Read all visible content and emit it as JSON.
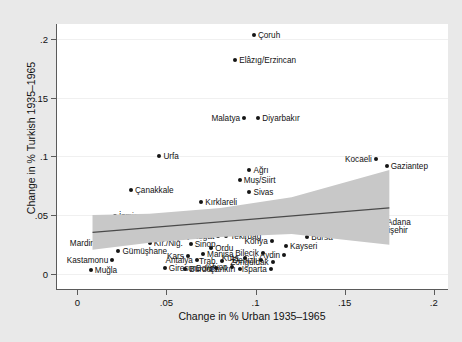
{
  "chart_data": {
    "type": "scatter",
    "title": "",
    "xlabel": "Change in % Urban 1935–1965",
    "ylabel": "Change in % Turkish 1935–1965",
    "xlim": [
      -0.012,
      0.208
    ],
    "ylim": [
      -0.014,
      0.213
    ],
    "xticks": [
      "0",
      ".05",
      ".1",
      ".15",
      ".2"
    ],
    "xtick_values": [
      0,
      0.05,
      0.1,
      0.15,
      0.2
    ],
    "yticks": [
      "0",
      ".05",
      ".1",
      ".15",
      ".2"
    ],
    "ytick_values": [
      0,
      0.05,
      0.1,
      0.15,
      0.2
    ],
    "grid": "horizontal-light",
    "legend": "none",
    "marker_color": "#151515",
    "fit_line_color": "#4a4a4a",
    "ci_band_color": "#c8c8c8",
    "fit_line": {
      "x": [
        0.008,
        0.175
      ],
      "y": [
        0.0345,
        0.0555
      ]
    },
    "ci_band": {
      "x": [
        0.008,
        0.04,
        0.08,
        0.12,
        0.175
      ],
      "upper": [
        0.0495,
        0.0505,
        0.0555,
        0.0645,
        0.088
      ],
      "lower": [
        0.0195,
        0.0255,
        0.0305,
        0.033,
        0.024
      ]
    },
    "points": [
      {
        "label": "Çoruh",
        "x": 0.0985,
        "y": 0.2035,
        "side": "right"
      },
      {
        "label": "Elâzıg/Erzincan",
        "x": 0.088,
        "y": 0.182,
        "side": "right"
      },
      {
        "label": "Malatya",
        "x": 0.093,
        "y": 0.133,
        "side": "left"
      },
      {
        "label": "Diyarbakır",
        "x": 0.101,
        "y": 0.1325,
        "side": "right"
      },
      {
        "label": "Urfa",
        "x": 0.0455,
        "y": 0.1,
        "side": "right"
      },
      {
        "label": "Kocaeli",
        "x": 0.167,
        "y": 0.098,
        "side": "left"
      },
      {
        "label": "Gaziantep",
        "x": 0.173,
        "y": 0.092,
        "side": "right"
      },
      {
        "label": "Ağrı",
        "x": 0.096,
        "y": 0.088,
        "side": "right"
      },
      {
        "label": "Muş/Siirt",
        "x": 0.0905,
        "y": 0.0795,
        "side": "right"
      },
      {
        "label": "Çanakkale",
        "x": 0.0295,
        "y": 0.0715,
        "side": "right"
      },
      {
        "label": "Sivas",
        "x": 0.096,
        "y": 0.07,
        "side": "right"
      },
      {
        "label": "Kırklareli",
        "x": 0.069,
        "y": 0.0615,
        "side": "right"
      },
      {
        "label": "Balıkesir",
        "x": 0.107,
        "y": 0.0545,
        "side": "right"
      },
      {
        "label": "Adana",
        "x": 0.171,
        "y": 0.044,
        "side": "right"
      },
      {
        "label": "İzmir",
        "x": 0.0205,
        "y": 0.049,
        "side": "right"
      },
      {
        "label": "Çorum",
        "x": 0.0465,
        "y": 0.045,
        "side": "right"
      },
      {
        "label": "Erzurum",
        "x": 0.111,
        "y": 0.042,
        "side": "right"
      },
      {
        "label": "Eskişehir",
        "x": 0.164,
        "y": 0.0375,
        "side": "right"
      },
      {
        "label": "Edirne",
        "x": 0.0345,
        "y": 0.041,
        "side": "left"
      },
      {
        "label": "Samsun",
        "x": 0.08,
        "y": 0.043,
        "side": "left"
      },
      {
        "label": "İçel",
        "x": 0.102,
        "y": 0.0395,
        "side": "left"
      },
      {
        "label": "Tokat",
        "x": 0.084,
        "y": 0.0375,
        "side": "left"
      },
      {
        "label": "Maraş",
        "x": 0.0255,
        "y": 0.034,
        "side": "left"
      },
      {
        "label": "Amasya",
        "x": 0.047,
        "y": 0.033,
        "side": "right"
      },
      {
        "label": "Yozgat",
        "x": 0.0785,
        "y": 0.0325,
        "side": "left"
      },
      {
        "label": "Tekirdağ",
        "x": 0.083,
        "y": 0.0325,
        "side": "right"
      },
      {
        "label": "Bursa",
        "x": 0.1285,
        "y": 0.031,
        "side": "right"
      },
      {
        "label": "Mardin",
        "x": 0.0115,
        "y": 0.0265,
        "side": "left"
      },
      {
        "label": "Kır./Niğ.",
        "x": 0.04,
        "y": 0.026,
        "side": "right"
      },
      {
        "label": "Sinop",
        "x": 0.063,
        "y": 0.025,
        "side": "right"
      },
      {
        "label": "Konya",
        "x": 0.1085,
        "y": 0.0275,
        "side": "left"
      },
      {
        "label": "Kayseri",
        "x": 0.1165,
        "y": 0.0235,
        "side": "right"
      },
      {
        "label": "Gümüşhane",
        "x": 0.0225,
        "y": 0.0195,
        "side": "right"
      },
      {
        "label": "Ordu",
        "x": 0.0745,
        "y": 0.0215,
        "side": "right"
      },
      {
        "label": "Bilecik",
        "x": 0.1035,
        "y": 0.018,
        "side": "left"
      },
      {
        "label": "Aydin",
        "x": 0.1155,
        "y": 0.016,
        "side": "left"
      },
      {
        "label": "Kars",
        "x": 0.0615,
        "y": 0.015,
        "side": "left"
      },
      {
        "label": "Manisa",
        "x": 0.07,
        "y": 0.0165,
        "side": "right"
      },
      {
        "label": "Kastamonu",
        "x": 0.019,
        "y": 0.012,
        "side": "left"
      },
      {
        "label": "Antalya",
        "x": 0.0665,
        "y": 0.0115,
        "side": "left"
      },
      {
        "label": "Trab.",
        "x": 0.0805,
        "y": 0.011,
        "side": "left"
      },
      {
        "label": "Küta.",
        "x": 0.0935,
        "y": 0.0135,
        "side": "left"
      },
      {
        "label": "Denizli",
        "x": 0.1025,
        "y": 0.012,
        "side": "left"
      },
      {
        "label": "Zonguldak",
        "x": 0.109,
        "y": 0.0095,
        "side": "left"
      },
      {
        "label": "Muğla",
        "x": 0.007,
        "y": 0.003,
        "side": "right"
      },
      {
        "label": "Giresun",
        "x": 0.0485,
        "y": 0.0045,
        "side": "right"
      },
      {
        "label": "Burdur",
        "x": 0.06,
        "y": 0.004,
        "side": "right"
      },
      {
        "label": "Bolu",
        "x": 0.0775,
        "y": 0.0045,
        "side": "left"
      },
      {
        "label": "Afyon",
        "x": 0.086,
        "y": 0.006,
        "side": "left"
      },
      {
        "label": "Çankırı",
        "x": 0.0905,
        "y": 0.004,
        "side": "left"
      },
      {
        "label": "Isparta",
        "x": 0.108,
        "y": 0.004,
        "side": "left"
      }
    ]
  }
}
